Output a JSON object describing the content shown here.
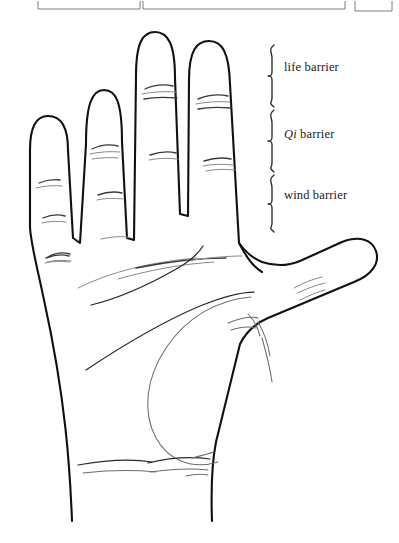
{
  "figure": {
    "kind": "line-drawing",
    "background_color": "#ffffff",
    "ink_color": "#111111",
    "faint_ink_color": "#8a8a8a",
    "width": 399,
    "height": 543
  },
  "top_frame": {
    "description": "bottom edges of three cut-off boxes along the very top of the page",
    "rule_color": "#7d7d7d",
    "segments": [
      {
        "name": "left-box-bottom-edge",
        "x1": 38,
        "x2": 140,
        "y": 9
      },
      {
        "name": "middle-box-bottom-edge",
        "x1": 143,
        "x2": 345,
        "y": 9
      },
      {
        "name": "right-box-bottom-edge",
        "x1": 355,
        "x2": 392,
        "y": 9
      }
    ]
  },
  "annotations": {
    "bracket_color": "#2a2a2a",
    "items": [
      {
        "id": "life",
        "label": "life barrier",
        "label_prefix": "",
        "label_text": "life barrier",
        "bracket_x": 272,
        "bracket_top": 45,
        "bracket_bottom": 107
      },
      {
        "id": "qi",
        "label": "Qi barrier",
        "label_prefix": "Qi",
        "label_text": " barrier",
        "bracket_x": 272,
        "bracket_top": 110,
        "bracket_bottom": 172
      },
      {
        "id": "wind",
        "label": "wind barrier",
        "label_prefix": "",
        "label_text": "wind barrier",
        "bracket_x": 272,
        "bracket_top": 175,
        "bracket_bottom": 232
      }
    ]
  },
  "hand": {
    "digits": [
      {
        "name": "little-finger",
        "tip_y": 117,
        "crease_count": 3
      },
      {
        "name": "ring-finger",
        "tip_y": 68,
        "crease_count": 3
      },
      {
        "name": "middle-finger",
        "tip_y": 32,
        "crease_count": 2
      },
      {
        "name": "index-finger",
        "tip_y": 42,
        "crease_count": 2
      },
      {
        "name": "thumb",
        "tip_y": 243,
        "crease_count": 2
      }
    ],
    "palm_features": [
      "heart-line",
      "head-line",
      "life-line-arc",
      "thenar-eminence",
      "wrist-crease-upper",
      "wrist-crease-lower"
    ]
  }
}
